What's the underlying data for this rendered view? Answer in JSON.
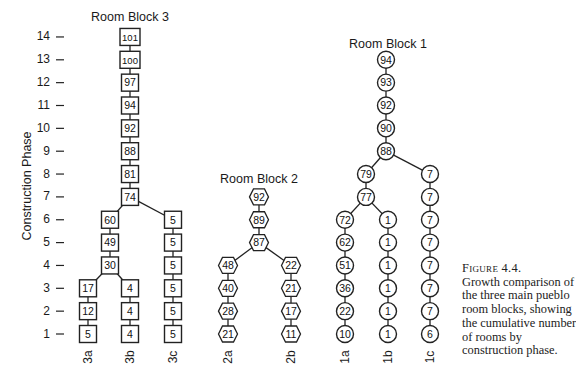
{
  "axis": {
    "title": "Construction Phase",
    "ticks": [
      "1",
      "2",
      "3",
      "4",
      "5",
      "6",
      "7",
      "8",
      "9",
      "10",
      "11",
      "12",
      "13",
      "14"
    ]
  },
  "blocks": [
    {
      "id": "block3",
      "title": "Room Block 3",
      "shape": "square"
    },
    {
      "id": "block2",
      "title": "Room Block 2",
      "shape": "hexagon"
    },
    {
      "id": "block1",
      "title": "Room Block 1",
      "shape": "circle"
    }
  ],
  "columns": [
    "3a",
    "3b",
    "3c",
    "2a",
    "2b",
    "1a",
    "1b",
    "1c"
  ],
  "caption": {
    "figure_number": "Figure 4.4.",
    "lines": [
      "Growth comparison of",
      "the three main pueblo",
      "room blocks, showing",
      "the cumulative number",
      "of rooms by",
      "construction phase."
    ]
  },
  "chart_data": {
    "type": "tree",
    "title": "Growth comparison of the three main pueblo room blocks, showing the cumulative number of rooms by construction phase",
    "ylabel": "Construction Phase",
    "ylim": [
      1,
      14
    ],
    "units": "cumulative number of rooms",
    "room_blocks": [
      {
        "name": "Room Block 3",
        "shape": "square",
        "trunk": {
          "phases": [
            14,
            13,
            12,
            11,
            10,
            9,
            8,
            7
          ],
          "values": [
            101,
            100,
            97,
            94,
            92,
            88,
            81,
            74
          ]
        },
        "branches": [
          {
            "name": "3a+3b",
            "phases": [
              6,
              5,
              4
            ],
            "values": [
              60,
              49,
              30
            ]
          },
          {
            "name": "3a",
            "phases": [
              3,
              2,
              1
            ],
            "values": [
              17,
              12,
              5
            ]
          },
          {
            "name": "3b",
            "phases": [
              3,
              2,
              1
            ],
            "values": [
              4,
              4,
              4
            ]
          },
          {
            "name": "3c",
            "phases": [
              6,
              5,
              4,
              3,
              2,
              1
            ],
            "values": [
              5,
              5,
              5,
              5,
              5,
              5
            ]
          }
        ]
      },
      {
        "name": "Room Block 2",
        "shape": "hexagon",
        "trunk": {
          "phases": [
            7,
            6,
            5
          ],
          "values": [
            92,
            89,
            87
          ]
        },
        "branches": [
          {
            "name": "2a",
            "phases": [
              4,
              3,
              2,
              1
            ],
            "values": [
              48,
              40,
              28,
              21
            ]
          },
          {
            "name": "2b",
            "phases": [
              4,
              3,
              2,
              1
            ],
            "values": [
              22,
              21,
              17,
              11
            ]
          }
        ]
      },
      {
        "name": "Room Block 1",
        "shape": "circle",
        "trunk": {
          "phases": [
            13,
            12,
            11,
            10,
            9
          ],
          "values": [
            94,
            93,
            92,
            90,
            88
          ]
        },
        "branches": [
          {
            "name": "1a+1b",
            "phases": [
              8,
              7
            ],
            "values": [
              79,
              77
            ]
          },
          {
            "name": "1a",
            "phases": [
              6,
              5,
              4,
              3,
              2,
              1
            ],
            "values": [
              72,
              62,
              51,
              36,
              22,
              10
            ]
          },
          {
            "name": "1b",
            "phases": [
              6,
              5,
              4,
              3,
              2,
              1
            ],
            "values": [
              1,
              1,
              1,
              1,
              1,
              1
            ]
          },
          {
            "name": "1c",
            "phases": [
              8,
              7,
              6,
              5,
              4,
              3,
              2,
              1
            ],
            "values": [
              7,
              7,
              7,
              7,
              7,
              7,
              7,
              6
            ]
          }
        ]
      }
    ]
  }
}
